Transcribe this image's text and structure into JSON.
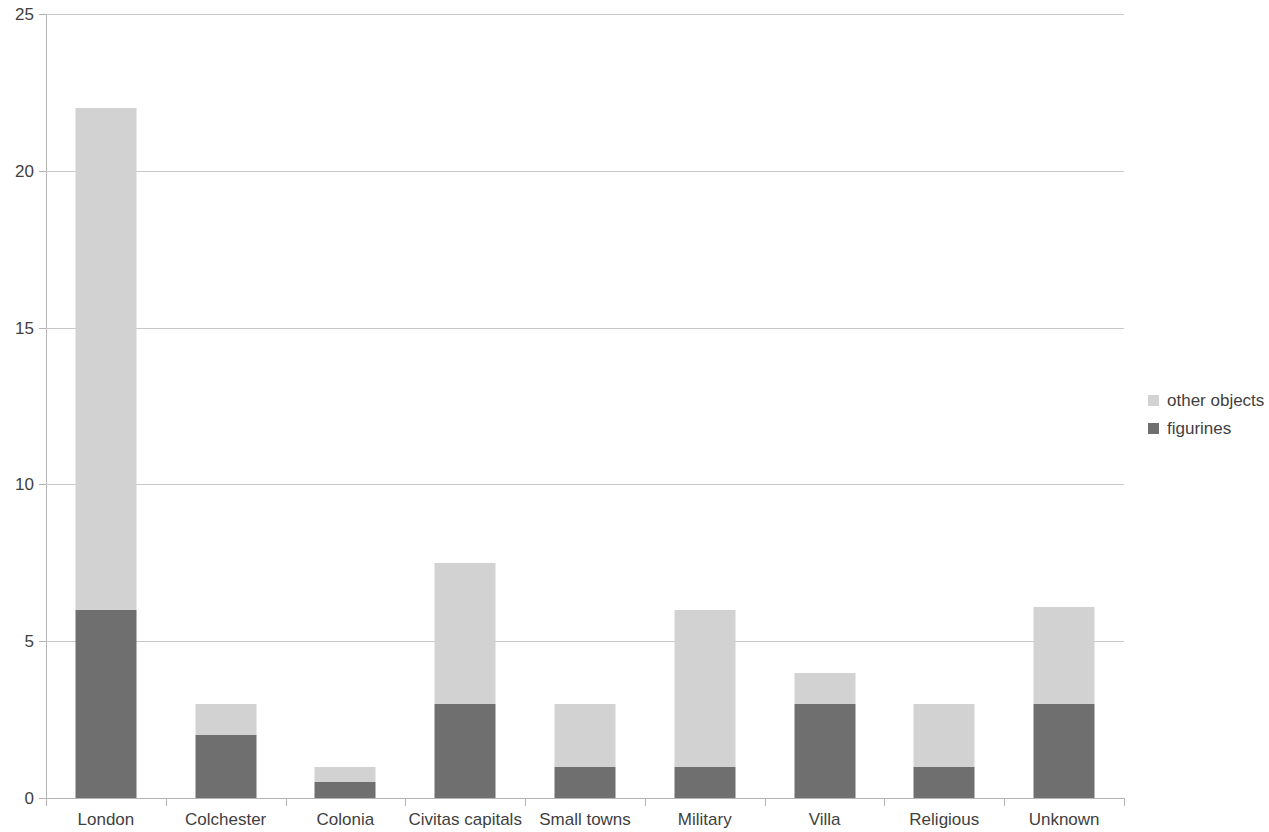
{
  "chart_data": {
    "type": "bar",
    "subtype": "stacked-vertical",
    "title": "",
    "subtitle": "",
    "xlabel": "",
    "ylabel": "",
    "ylim": [
      0,
      25
    ],
    "ytick_labels": [
      "0",
      "5",
      "10",
      "15",
      "20",
      "25"
    ],
    "ytick_values": [
      0,
      5,
      10,
      15,
      20,
      25
    ],
    "grid": true,
    "grid_axis": "y",
    "legend_position": "right",
    "categories": [
      "London",
      "Colchester",
      "Colonia",
      "Civitas capitals",
      "Small towns",
      "Military",
      "Villa",
      "Religious",
      "Unknown"
    ],
    "series": [
      {
        "name": "figurines",
        "color": "#6f6f6f",
        "values": [
          6,
          2,
          0.5,
          3,
          1,
          1,
          3,
          1,
          3
        ]
      },
      {
        "name": "other objects",
        "color": "#d2d2d2",
        "values": [
          16,
          1,
          0.5,
          4.5,
          2,
          5,
          1,
          2,
          3.1
        ]
      }
    ],
    "stack_order_bottom_to_top": [
      "figurines",
      "other objects"
    ],
    "totals": [
      22,
      3,
      1,
      7.5,
      3,
      6,
      4,
      3,
      6.1
    ]
  },
  "legend": {
    "items": [
      {
        "label": "other objects",
        "swatch": "other"
      },
      {
        "label": "figurines",
        "swatch": "figs"
      }
    ]
  },
  "colors": {
    "other_objects": "#d2d2d2",
    "figurines": "#6f6f6f",
    "gridline": "#c8c8c8",
    "axis": "#b4b4b4",
    "text": "#3f3f3f",
    "background": "#ffffff"
  }
}
